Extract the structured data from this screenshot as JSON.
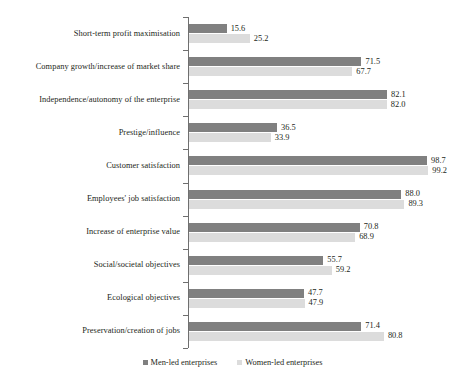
{
  "chart_data": {
    "type": "bar",
    "orientation": "horizontal",
    "title": "",
    "subtitle": "",
    "xlabel": "",
    "ylabel": "",
    "xlim": [
      0,
      100
    ],
    "grid": false,
    "legend_position": "bottom",
    "categories": [
      "Short-term profit maximisation",
      "Company growth/increase of market share",
      "Independence/autonomy of the enterprise",
      "Prestige/influence",
      "Customer satisfaction",
      "Employees' job satisfaction",
      "Increase of enterprise value",
      "Social/societal objectives",
      "Ecological objectives",
      "Preservation/creation of jobs"
    ],
    "series": [
      {
        "name": "Men-led enterprises",
        "color": "#808080",
        "values": [
          15.6,
          71.5,
          82.1,
          36.5,
          98.7,
          88.0,
          70.8,
          55.7,
          47.7,
          71.4
        ],
        "labels": [
          "15.6",
          "71.5",
          "82.1",
          "36.5",
          "98.7",
          "88.0",
          "70.8",
          "55.7",
          "47.7",
          "71.4"
        ]
      },
      {
        "name": "Women-led enterprises",
        "color": "#dcdcdc",
        "values": [
          25.2,
          67.7,
          82.0,
          33.9,
          99.2,
          89.3,
          68.9,
          59.2,
          47.9,
          80.8
        ],
        "labels": [
          "25.2",
          "67.7",
          "82.0",
          "33.9",
          "99.2",
          "89.3",
          "68.9",
          "59.2",
          "47.9",
          "80.8"
        ]
      }
    ]
  },
  "legend": {
    "items": [
      {
        "label": "Men-led enterprises",
        "swatch": "legend-swatch-men"
      },
      {
        "label": "Women-led enterprises",
        "swatch": "legend-swatch-women"
      }
    ]
  }
}
